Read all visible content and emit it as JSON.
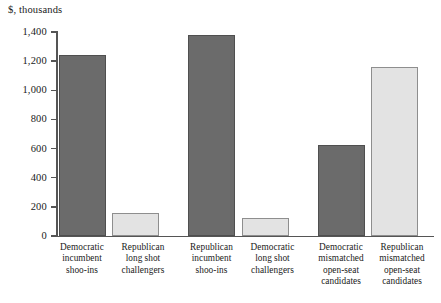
{
  "chart_data": {
    "type": "bar",
    "title": "",
    "subtitle": "",
    "xlabel": "",
    "ylabel": "$, thousands",
    "ylim": [
      0,
      1400
    ],
    "yticks": [
      0,
      200,
      400,
      600,
      800,
      1000,
      1200,
      1400
    ],
    "ytick_labels": [
      "0",
      "200",
      "400",
      "600",
      "800",
      "1,000",
      "1,200",
      "1,400"
    ],
    "grid": false,
    "legend": "none",
    "categories": [
      "Democratic incumbent shoo-ins",
      "Republican long shot challengers",
      "Republican incumbent shoo-ins",
      "Democratic long shot challengers",
      "Democratic mismatched open-seat candidates",
      "Republican mismatched open-seat candidates"
    ],
    "category_lines": [
      [
        "Democratic",
        "incumbent",
        "shoo-ins"
      ],
      [
        "Republican",
        "long shot",
        "challengers"
      ],
      [
        "Republican",
        "incumbent",
        "shoo-ins"
      ],
      [
        "Democratic",
        "long shot",
        "challengers"
      ],
      [
        "Democratic",
        "mismatched",
        "open-seat",
        "candidates"
      ],
      [
        "Republican",
        "mismatched",
        "open-seat",
        "candidates"
      ]
    ],
    "values": [
      1240,
      160,
      1380,
      125,
      625,
      1160
    ],
    "bar_colors": [
      "#6b6b6b",
      "#e3e3e3",
      "#6b6b6b",
      "#e3e3e3",
      "#6b6b6b",
      "#e3e3e3"
    ],
    "bar_styles": [
      "dark",
      "light",
      "dark",
      "light",
      "dark",
      "light"
    ]
  },
  "colors": {
    "dark_bar": "#6b6b6b",
    "dark_bar_border": "#4f4f4f",
    "light_bar": "#e3e3e3",
    "light_bar_border": "#8e8e8e",
    "axis": "#555555",
    "background": "#ffffff",
    "text": "#1a1a1a"
  },
  "geometry": {
    "bars": [
      {
        "left": 58.5,
        "width": 47
      },
      {
        "left": 112.0,
        "width": 47
      },
      {
        "left": 188.0,
        "width": 47
      },
      {
        "left": 241.5,
        "width": 47
      },
      {
        "left": 317.5,
        "width": 47
      },
      {
        "left": 371.0,
        "width": 47
      }
    ],
    "label_boxes": [
      {
        "left": 52.0,
        "width": 60
      },
      {
        "left": 112.0,
        "width": 62
      },
      {
        "left": 181.5,
        "width": 60
      },
      {
        "left": 241.5,
        "width": 62
      },
      {
        "left": 308.0,
        "width": 66
      },
      {
        "left": 369.0,
        "width": 66
      }
    ]
  }
}
